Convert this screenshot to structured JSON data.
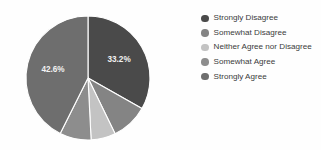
{
  "chart_data": {
    "type": "pie",
    "title": "",
    "legend_position": "right",
    "categories": [
      "Strongly Disagree",
      "Somewhat Disagree",
      "Neither Agree nor Disagree",
      "Somewhat Agree",
      "Strongly Agree"
    ],
    "values": [
      33.2,
      9.6,
      6.4,
      8.2,
      42.6
    ],
    "value_unit": "%",
    "labels_shown": [
      "33.2%",
      "",
      "",
      "",
      "42.6%"
    ],
    "colors": [
      "#4a4a4a",
      "#848484",
      "#c3c3c3",
      "#8d8d8d",
      "#6e6e6e"
    ],
    "slice_border_color": "#ffffff",
    "label_text_color": "#f2f2f2",
    "start_angle_deg": 0,
    "direction": "clockwise"
  },
  "pie": {
    "slices": [
      {
        "name": "Strongly Disagree",
        "percent": 33.2,
        "label": "33.2%",
        "color": "#4a4a4a"
      },
      {
        "name": "Somewhat Disagree",
        "percent": 9.6,
        "label": "",
        "color": "#848484"
      },
      {
        "name": "Neither Agree nor Disagree",
        "percent": 6.4,
        "label": "",
        "color": "#c3c3c3"
      },
      {
        "name": "Somewhat Agree",
        "percent": 8.2,
        "label": "",
        "color": "#8d8d8d"
      },
      {
        "name": "Strongly Agree",
        "percent": 42.6,
        "label": "42.6%",
        "color": "#6e6e6e"
      }
    ]
  },
  "legend": {
    "items": [
      {
        "label": "Strongly Disagree",
        "color": "#4a4a4a"
      },
      {
        "label": "Somewhat Disagree",
        "color": "#848484"
      },
      {
        "label": "Neither Agree nor Disagree",
        "color": "#c3c3c3"
      },
      {
        "label": "Somewhat Agree",
        "color": "#8d8d8d"
      },
      {
        "label": "Strongly Agree",
        "color": "#6e6e6e"
      }
    ]
  }
}
